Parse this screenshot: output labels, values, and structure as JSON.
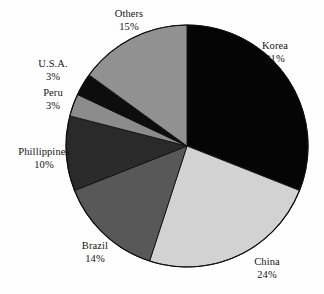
{
  "chart_data": {
    "type": "pie",
    "title": "",
    "subtitle": "",
    "xlabel": "",
    "ylabel": "",
    "legend_position": "none",
    "grid": false,
    "labels_outside": true,
    "start_angle_deg": 0,
    "direction": "clockwise",
    "units": "percent",
    "total": 100,
    "categories": [
      "Korea",
      "China",
      "Brazil",
      "Phillippines",
      "Peru",
      "U.S.A.",
      "Others"
    ],
    "values": [
      31,
      24,
      14,
      10,
      3,
      3,
      15
    ],
    "slices": [
      {
        "label": "Korea",
        "value": 31,
        "value_text": "31%",
        "color": "#050505"
      },
      {
        "label": "China",
        "value": 24,
        "value_text": "24%",
        "color": "#d2d2d2"
      },
      {
        "label": "Brazil",
        "value": 14,
        "value_text": "14%",
        "color": "#585858"
      },
      {
        "label": "Phillippines",
        "value": 10,
        "value_text": "10%",
        "color": "#2a2a2a"
      },
      {
        "label": "Peru",
        "value": 3,
        "value_text": "3%",
        "color": "#8c8c8c"
      },
      {
        "label": "U.S.A.",
        "value": 3,
        "value_text": "3%",
        "color": "#0d0d0d"
      },
      {
        "label": "Others",
        "value": 15,
        "value_text": "15%",
        "color": "#919191"
      }
    ]
  },
  "geometry": {
    "center_x": 187,
    "center_y": 146,
    "radius": 121,
    "outline_color": "#101010",
    "background": "#fefefe"
  }
}
